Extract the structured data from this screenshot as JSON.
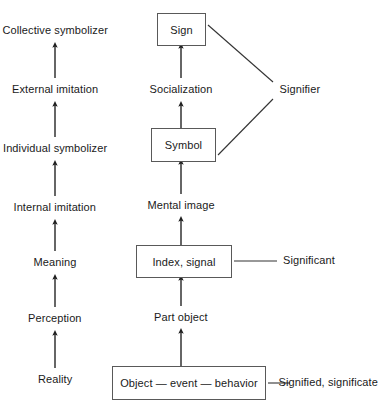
{
  "diagram": {
    "background_color": "#ffffff",
    "line_color": "#333333",
    "box_border_color": "#595959",
    "left_column": {
      "name": "developmental-stages",
      "items": [
        {
          "label": "Collective symbolizer",
          "x": 55,
          "y": 31
        },
        {
          "label": "External imitation",
          "x": 55,
          "y": 90
        },
        {
          "label": "Individual symbolizer",
          "x": 55,
          "y": 149
        },
        {
          "label": "Internal imitation",
          "x": 55,
          "y": 208
        },
        {
          "label": "Meaning",
          "x": 55,
          "y": 263
        },
        {
          "label": "Perception",
          "x": 55,
          "y": 319
        },
        {
          "label": "Reality",
          "x": 55,
          "y": 380
        }
      ],
      "arrows": [
        {
          "x": 55,
          "y1": 78,
          "y2": 45
        },
        {
          "x": 55,
          "y1": 137,
          "y2": 104
        },
        {
          "x": 55,
          "y1": 196,
          "y2": 163
        },
        {
          "x": 55,
          "y1": 251,
          "y2": 222
        },
        {
          "x": 55,
          "y1": 307,
          "y2": 277
        },
        {
          "x": 55,
          "y1": 368,
          "y2": 333
        }
      ]
    },
    "center_column": {
      "name": "semiotic-objects",
      "boxes": [
        {
          "label": "Sign",
          "x": 157,
          "y": 13,
          "w": 49,
          "h": 33
        },
        {
          "label": "Symbol",
          "x": 151,
          "y": 128,
          "w": 65,
          "h": 34
        },
        {
          "label": "Index, signal",
          "x": 136,
          "y": 245,
          "w": 96,
          "h": 33
        },
        {
          "label": "Object — event — behavior",
          "x": 112,
          "y": 366,
          "w": 154,
          "h": 34
        }
      ],
      "labels": [
        {
          "label": "Socialization",
          "x": 181,
          "y": 90
        },
        {
          "label": "Mental image",
          "x": 181,
          "y": 206
        },
        {
          "label": "Part object",
          "x": 181,
          "y": 318
        }
      ],
      "arrows": [
        {
          "x": 181,
          "y1": 78,
          "y2": 46
        },
        {
          "x": 181,
          "y1": 162,
          "y2": 104
        },
        {
          "x": 181,
          "y1": 194,
          "y2": 162
        },
        {
          "x": 181,
          "y1": 245,
          "y2": 219
        },
        {
          "x": 181,
          "y1": 306,
          "y2": 278
        },
        {
          "x": 181,
          "y1": 366,
          "y2": 331
        }
      ]
    },
    "right_column": {
      "name": "semiotic-terms",
      "items": [
        {
          "label": "Signifier",
          "x": 300,
          "y": 90
        },
        {
          "label": "Significant",
          "x": 309,
          "y": 261
        },
        {
          "label": "Signified, significate",
          "x": 328,
          "y": 383
        }
      ],
      "connectors": [
        {
          "name": "signifier-to-sign",
          "x1": 273,
          "y1": 82,
          "x2": 208,
          "y2": 25
        },
        {
          "name": "signifier-to-symbol",
          "x1": 273,
          "y1": 99,
          "x2": 218,
          "y2": 155
        },
        {
          "name": "significant-to-index",
          "x1": 234,
          "y1": 261,
          "x2": 277,
          "y2": 261
        },
        {
          "name": "signified-to-object",
          "x1": 268,
          "y1": 383,
          "x2": 290,
          "y2": 383
        }
      ]
    }
  }
}
